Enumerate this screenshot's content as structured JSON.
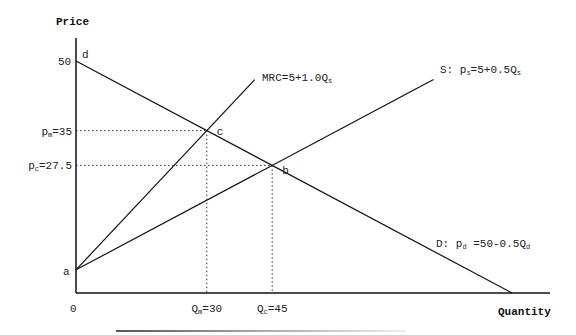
{
  "diagram": {
    "axes": {
      "y_label": "Price",
      "x_label": "Quantity",
      "origin_label": "0",
      "y_tick_label": "50"
    },
    "scale": {
      "q_max": 100,
      "p_max": 50
    },
    "curves": [
      {
        "id": "demand",
        "label_prefix": "D: p",
        "label_sub": "d",
        "label_rest": " =50-0.5Q",
        "label_sub2": "d",
        "intercept": 50,
        "slope": -0.5,
        "q_end": 100
      },
      {
        "id": "supply",
        "label_prefix": "S: p",
        "label_sub": "s",
        "label_rest": "=5+0.5Q",
        "label_sub2": "s",
        "intercept": 5,
        "slope": 0.5,
        "q_end": 82
      },
      {
        "id": "mrc",
        "label_prefix": "MRC=5+1.0Q",
        "label_sub": "s",
        "intercept": 5,
        "slope": 1.0,
        "q_end": 41
      }
    ],
    "points": {
      "a": {
        "label": "a",
        "q": 0,
        "p": 5
      },
      "b": {
        "label": "b",
        "q": 45,
        "p": 27.5
      },
      "c": {
        "label": "c",
        "q": 30,
        "p": 35
      },
      "d": {
        "label": "d",
        "q": 0,
        "p": 50
      }
    },
    "price_levels": [
      {
        "sym": "p",
        "sub": "m",
        "value": "=35",
        "p": 35,
        "q": 30
      },
      {
        "sym": "p",
        "sub": "c",
        "value": "=27.5",
        "p": 27.5,
        "q": 45
      }
    ],
    "quantity_levels": [
      {
        "sym": "Q",
        "sub": "m",
        "value": "=30",
        "q": 30,
        "p": 35
      },
      {
        "sym": "Q",
        "sub": "c",
        "value": "=45",
        "q": 45,
        "p": 27.5
      }
    ]
  }
}
